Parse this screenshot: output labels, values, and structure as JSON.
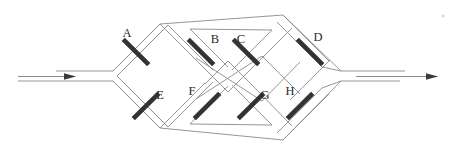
{
  "figure": {
    "background_color": "#ffffff",
    "width": 454,
    "height": 156,
    "rail_color": "#8a8a8a",
    "mirror_color": "#333333",
    "label_color": "#2b2b2b",
    "arrow_color": "#3a3a3a"
  },
  "ports": {
    "input": {
      "name": "input-beam",
      "arrow_direction": "right",
      "rail_count": 2,
      "x_start": 18,
      "x_end": 112,
      "y_top": 71,
      "y_bottom": 81
    },
    "output": {
      "name": "output-beam",
      "arrow_direction": "right",
      "rail_count": 2,
      "x_start": 340,
      "x_end": 440,
      "y_top": 71,
      "y_bottom": 81
    }
  },
  "mirrors": [
    {
      "id": "A",
      "label": "A",
      "orientation": "nw-se",
      "cx": 136,
      "cy": 52,
      "label_x": 127,
      "label_y": 37
    },
    {
      "id": "B",
      "label": "B",
      "orientation": "nw-se",
      "cx": 201,
      "cy": 52,
      "label_x": 215,
      "label_y": 43
    },
    {
      "id": "C",
      "label": "C",
      "orientation": "nw-se",
      "cx": 246,
      "cy": 52,
      "label_x": 241,
      "label_y": 43
    },
    {
      "id": "D",
      "label": "D",
      "orientation": "nw-se",
      "cx": 310,
      "cy": 52,
      "label_x": 318,
      "label_y": 41
    },
    {
      "id": "E",
      "label": "E",
      "orientation": "ne-sw",
      "cx": 146,
      "cy": 106,
      "label_x": 160,
      "label_y": 99
    },
    {
      "id": "F",
      "label": "F",
      "orientation": "ne-sw",
      "cx": 207,
      "cy": 106,
      "label_x": 192,
      "label_y": 95
    },
    {
      "id": "G",
      "label": "G",
      "orientation": "ne-sw",
      "cx": 251,
      "cy": 106,
      "label_x": 265,
      "label_y": 99
    },
    {
      "id": "H",
      "label": "H",
      "orientation": "ne-sw",
      "cx": 300,
      "cy": 106,
      "label_x": 290,
      "label_y": 95
    }
  ],
  "labels": {
    "order": [
      "A",
      "B",
      "C",
      "D",
      "E",
      "F",
      "G",
      "H"
    ],
    "top_row": [
      "A",
      "B",
      "C",
      "D"
    ],
    "bottom_row": [
      "E",
      "F",
      "G",
      "H"
    ]
  }
}
